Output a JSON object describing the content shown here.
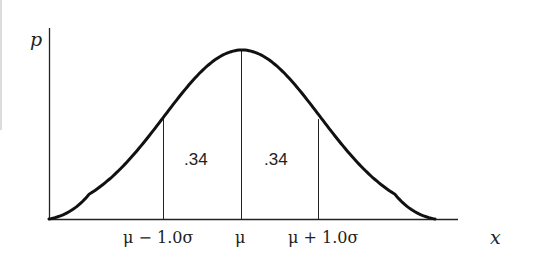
{
  "figure": {
    "type": "normal-distribution-diagram",
    "y_axis_label": "p",
    "x_axis_label": "x",
    "tick_labels": {
      "minus_sigma": "μ − 1.0σ",
      "mean": "μ",
      "plus_sigma": "μ + 1.0σ"
    },
    "region_labels": {
      "left": ".34",
      "right": ".34"
    },
    "colors": {
      "line": "#111111",
      "background": "#ffffff"
    }
  }
}
